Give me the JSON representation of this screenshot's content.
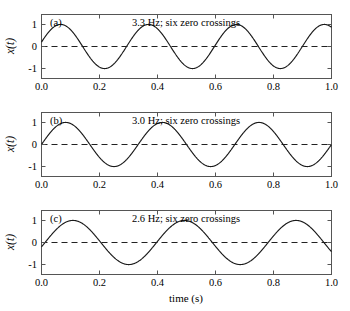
{
  "figure": {
    "name": "three-sinusoids-zero-crossings",
    "xlabel": "time (s)",
    "ylabel": "x(t)",
    "background": "#ffffff",
    "line_color": "#1a1a1a",
    "axis_color": "#555555",
    "zero_line_color": "#222222"
  },
  "chart_data": [
    {
      "type": "line",
      "panel_label": "(a)",
      "title": "3.3 Hz; six zero crossings",
      "xlabel": "",
      "ylabel": "x(t)",
      "xlim": [
        0.0,
        1.0
      ],
      "ylim": [
        -1.45,
        1.45
      ],
      "xticks": [
        0.0,
        0.2,
        0.4,
        0.6,
        0.8,
        1.0
      ],
      "xticklabels": [
        "0.0",
        "0.2",
        "0.4",
        "0.6",
        "0.8",
        "1.0"
      ],
      "yticks": [
        -1,
        0,
        1
      ],
      "yticklabels": [
        "-1",
        "0",
        "1"
      ],
      "grid": false,
      "legend": "none",
      "zero_reference_line": true,
      "series": [
        {
          "name": "3.3 Hz sinusoid",
          "frequency_hz": 3.3,
          "amplitude": 1.0,
          "phase_rad": 0.2,
          "equation": "x(t) = sin(2*pi*3.3*t + 0.2)",
          "x": [
            0.0,
            0.05,
            0.1,
            0.15,
            0.2,
            0.25,
            0.3,
            0.35,
            0.4,
            0.45,
            0.5,
            0.55,
            0.6,
            0.65,
            0.7,
            0.75,
            0.8,
            0.85,
            0.9,
            0.95,
            1.0
          ],
          "y": [
            0.199,
            0.927,
            0.927,
            0.199,
            -0.663,
            -1.0,
            -0.482,
            0.427,
            0.995,
            0.745,
            -0.075,
            -0.841,
            -0.975,
            -0.335,
            0.568,
            1.0,
            0.592,
            -0.305,
            -0.968,
            -0.858,
            -0.108
          ],
          "zero_crossings": [
            0.139,
            0.29,
            0.442,
            0.594,
            0.745,
            0.897
          ]
        }
      ]
    },
    {
      "type": "line",
      "panel_label": "(b)",
      "title": "3.0 Hz; six zero crossings",
      "xlabel": "",
      "ylabel": "x(t)",
      "xlim": [
        0.0,
        1.0
      ],
      "ylim": [
        -1.45,
        1.45
      ],
      "xticks": [
        0.0,
        0.2,
        0.4,
        0.6,
        0.8,
        1.0
      ],
      "xticklabels": [
        "0.0",
        "0.2",
        "0.4",
        "0.6",
        "0.8",
        "1.0"
      ],
      "yticks": [
        -1,
        0,
        1
      ],
      "yticklabels": [
        "-1",
        "0",
        "1"
      ],
      "grid": false,
      "legend": "none",
      "zero_reference_line": true,
      "series": [
        {
          "name": "3.0 Hz sinusoid",
          "frequency_hz": 3.0,
          "amplitude": 1.0,
          "phase_rad": 0.0,
          "equation": "x(t) = sin(2*pi*3.0*t)",
          "x": [
            0.0,
            0.05,
            0.1,
            0.15,
            0.2,
            0.25,
            0.3,
            0.35,
            0.4,
            0.45,
            0.5,
            0.55,
            0.6,
            0.65,
            0.7,
            0.75,
            0.8,
            0.85,
            0.9,
            0.95,
            1.0
          ],
          "y": [
            0.0,
            0.809,
            0.951,
            0.309,
            -0.588,
            -1.0,
            -0.588,
            0.309,
            0.951,
            0.809,
            0.0,
            -0.809,
            -0.951,
            -0.309,
            0.588,
            1.0,
            0.588,
            -0.309,
            -0.951,
            -0.809,
            0.0
          ],
          "zero_crossings": [
            0.1667,
            0.3333,
            0.5,
            0.6667,
            0.8333,
            1.0
          ]
        }
      ]
    },
    {
      "type": "line",
      "panel_label": "(c)",
      "title": "2.6 Hz; six zero crossings",
      "xlabel": "time (s)",
      "ylabel": "x(t)",
      "xlim": [
        0.0,
        1.0
      ],
      "ylim": [
        -1.45,
        1.45
      ],
      "xticks": [
        0.0,
        0.2,
        0.4,
        0.6,
        0.8,
        1.0
      ],
      "xticklabels": [
        "0.0",
        "0.2",
        "0.4",
        "0.6",
        "0.8",
        "1.0"
      ],
      "yticks": [
        -1,
        0,
        1
      ],
      "yticklabels": [
        "-1",
        "0",
        "1"
      ],
      "grid": false,
      "legend": "none",
      "zero_reference_line": true,
      "series": [
        {
          "name": "2.6 Hz sinusoid",
          "frequency_hz": 2.6,
          "amplitude": 1.0,
          "phase_rad": -0.2,
          "equation": "x(t) = sin(2*pi*2.6*t - 0.2)",
          "x": [
            0.0,
            0.05,
            0.1,
            0.15,
            0.2,
            0.25,
            0.3,
            0.35,
            0.4,
            0.45,
            0.5,
            0.55,
            0.6,
            0.65,
            0.7,
            0.75,
            0.8,
            0.85,
            0.9,
            0.95,
            1.0
          ],
          "y": [
            -0.199,
            0.58,
            0.998,
            0.71,
            -0.025,
            -0.739,
            -0.999,
            -0.545,
            0.23,
            0.846,
            0.976,
            0.371,
            -0.424,
            -0.925,
            -0.919,
            -0.183,
            0.611,
            0.998,
            0.687,
            -0.064,
            -0.766
          ],
          "zero_crossings": [
            0.0122,
            0.2045,
            0.3968,
            0.5891,
            0.7814,
            0.9737
          ]
        }
      ]
    }
  ]
}
